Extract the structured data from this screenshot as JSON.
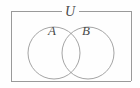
{
  "figure": {
    "type": "venn-diagram",
    "title": "",
    "width": 140,
    "height": 88,
    "background_color": "#fefefe",
    "stroke_color": "#9a9a9a",
    "label_color": "#4a4a4a",
    "universe": {
      "label": "U",
      "shape": "rectangle",
      "x": 11,
      "y": 11,
      "width": 120,
      "height": 70,
      "label_position": "top-border-center",
      "label_x": 70,
      "label_y": 15
    },
    "sets": [
      {
        "id": "set-a",
        "label": "A",
        "shape": "circle",
        "cx": 54,
        "cy": 53,
        "r": 26,
        "label_x": 52,
        "label_y": 34
      },
      {
        "id": "set-b",
        "label": "B",
        "shape": "circle",
        "cx": 88,
        "cy": 53,
        "r": 26,
        "label_x": 86,
        "label_y": 34
      }
    ],
    "regions": [
      {
        "id": "region-a-only",
        "name": "A only"
      },
      {
        "id": "region-intersection",
        "name": "A intersect B"
      },
      {
        "id": "region-b-only",
        "name": "B only"
      },
      {
        "id": "region-outside",
        "name": "complement of A union B within U"
      }
    ]
  }
}
